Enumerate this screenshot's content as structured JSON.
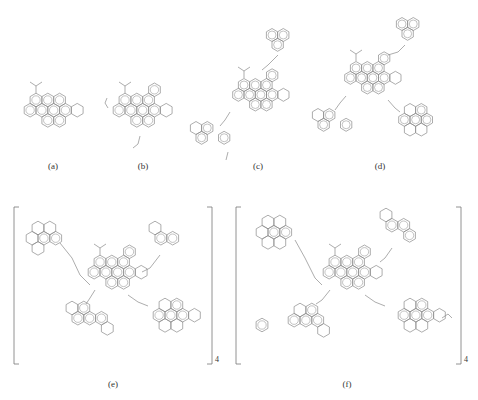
{
  "figure": {
    "panels": [
      {
        "id": "a",
        "label": "(a)",
        "description": "single polyaromatic core with isopropyl group and one saturated ring"
      },
      {
        "id": "b",
        "label": "(b)",
        "description": "larger polyaromatic core with ethyl and methyl substituents"
      },
      {
        "id": "c",
        "label": "(c)",
        "description": "core linked by alkyl chains to two aromatic fragments"
      },
      {
        "id": "d",
        "label": "(d)",
        "description": "core linked by alkyl chains to three aromatic fragments"
      },
      {
        "id": "e",
        "label": "(e)",
        "description": "bracketed repeating unit with four pendant aromatic fragments",
        "repeat_subscript": "4"
      },
      {
        "id": "f",
        "label": "(f)",
        "description": "bracketed repeating unit with substituted pendant fragments",
        "repeat_subscript": "4"
      }
    ]
  },
  "colors": {
    "line": "#8a8a8a",
    "background": "#ffffff",
    "text": "#333333"
  }
}
